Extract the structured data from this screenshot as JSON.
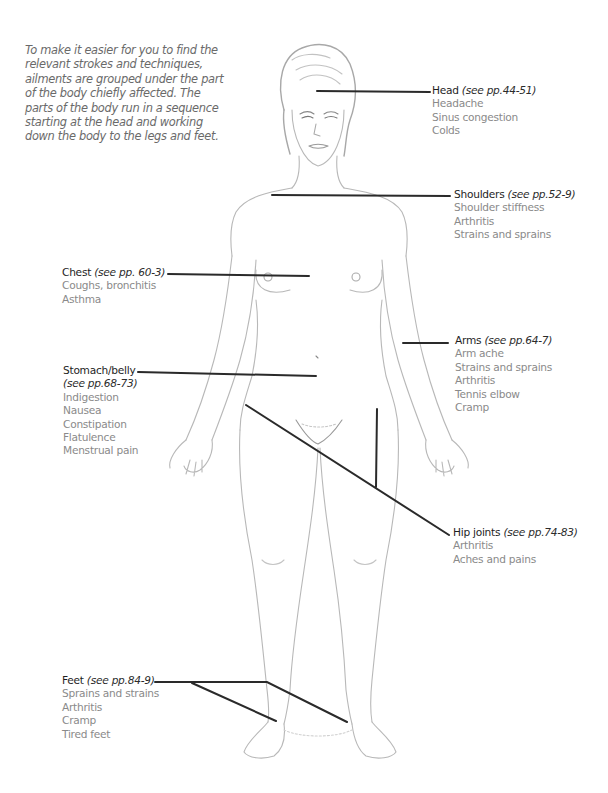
{
  "intro": "To make it easier for you to find the relevant strokes and techniques, ailments are grouped under the part of the body chiefly affected. The parts of the body run in a sequence starting at the head and working down the body to the legs and feet.",
  "colors": {
    "leader_line": "#2a2a2a",
    "title_text": "#1e1e1e",
    "item_text": "#8a8a8a",
    "intro_text": "#6a6a6a",
    "sketch": "#b8b8b8"
  },
  "regions": {
    "head": {
      "title": "Head",
      "ref": "(see pp.44-51)",
      "items": [
        "Headache",
        "Sinus congestion",
        "Colds"
      ]
    },
    "shoulders": {
      "title": "Shoulders",
      "ref": "(see pp.52-9)",
      "items": [
        "Shoulder stiffness",
        "Arthritis",
        "Strains and sprains"
      ]
    },
    "chest": {
      "title": "Chest",
      "ref": "(see pp. 60-3)",
      "items": [
        "Coughs, bronchitis",
        "Asthma"
      ]
    },
    "arms": {
      "title": "Arms",
      "ref": "(see pp.64-7)",
      "items": [
        "Arm ache",
        "Strains and sprains",
        "Arthritis",
        "Tennis elbow",
        "Cramp"
      ]
    },
    "stomach": {
      "title": "Stomach/belly",
      "ref": "(see pp.68-73)",
      "items": [
        "Indigestion",
        "Nausea",
        "Constipation",
        "Flatulence",
        "Menstrual pain"
      ]
    },
    "hips": {
      "title": "Hip joints",
      "ref": "(see pp.74-83)",
      "items": [
        "Arthritis",
        "Aches and pains"
      ]
    },
    "feet": {
      "title": "Feet",
      "ref": "(see pp.84-9)",
      "items": [
        "Sprains and strains",
        "Arthritis",
        "Cramp",
        "Tired feet"
      ]
    }
  }
}
